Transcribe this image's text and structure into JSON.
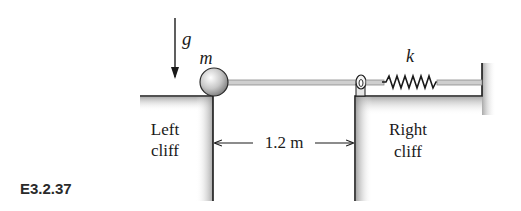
{
  "figure": {
    "id_label": "E3.2.37",
    "gravity_label": "g",
    "mass_label": "m",
    "spring_label": "k",
    "left_cliff": {
      "line1": "Left",
      "line2": "cliff"
    },
    "right_cliff": {
      "line1": "Right",
      "line2": "cliff"
    },
    "gap_dimension": "1.2 m"
  },
  "colors": {
    "line": "#1a1a1a",
    "shade": "#9a9a9a",
    "rod": "#bdbdbd",
    "ball_light": "#f2f2f2",
    "ball_dark": "#8a8a8a"
  }
}
